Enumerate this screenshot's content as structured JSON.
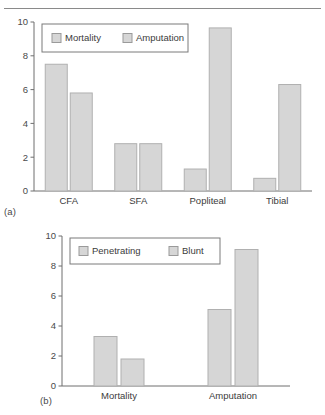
{
  "figure": {
    "background_color": "#ffffff",
    "bar_fill_color": "#d6d6d6",
    "bar_border_color": "#b0b0b0",
    "axis_color": "#6f6f6f",
    "text_color": "#3b3b3b",
    "panel_a_tag": "(a)",
    "panel_b_tag": "(b)"
  },
  "chart_data": [
    {
      "type": "bar",
      "panel": "(a)",
      "title": "",
      "xlabel": "",
      "ylabel": "",
      "categories": [
        "CFA",
        "SFA",
        "Popliteal",
        "Tibial"
      ],
      "series": [
        {
          "name": "Mortality",
          "values": [
            7.5,
            2.8,
            1.3,
            0.75
          ]
        },
        {
          "name": "Amputation",
          "values": [
            5.8,
            2.8,
            9.65,
            6.3
          ]
        }
      ],
      "ylim": [
        0,
        10
      ],
      "yticks": [
        0,
        2,
        4,
        6,
        8,
        10
      ],
      "ytick_labels": [
        "0",
        "2",
        "4",
        "6",
        "8",
        "10"
      ],
      "grid": false,
      "legend_position": "top-left",
      "legend_entries": [
        "Mortality",
        "Amputation"
      ]
    },
    {
      "type": "bar",
      "panel": "(b)",
      "title": "",
      "xlabel": "",
      "ylabel": "",
      "categories": [
        "Mortality",
        "Amputation"
      ],
      "series": [
        {
          "name": "Penetrating",
          "values": [
            3.3,
            5.1
          ]
        },
        {
          "name": "Blunt",
          "values": [
            1.8,
            9.1
          ]
        }
      ],
      "ylim": [
        0,
        10
      ],
      "yticks": [
        0,
        2,
        4,
        6,
        8,
        10
      ],
      "ytick_labels": [
        "0",
        "2",
        "4",
        "6",
        "8",
        "10"
      ],
      "grid": false,
      "legend_position": "top-left",
      "legend_entries": [
        "Penetrating",
        "Blunt"
      ]
    }
  ]
}
